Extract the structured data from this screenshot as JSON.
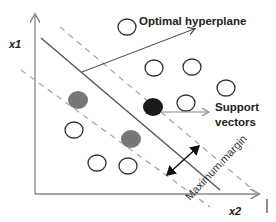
{
  "diagram": {
    "axes": {
      "y_label": "x1",
      "x_label": "x2"
    },
    "labels": {
      "hyperplane": "Optimal hyperplane",
      "support_line1": "Support",
      "support_line2": "vectors",
      "margin": "Maximum margin"
    },
    "colors": {
      "axis": "#888888",
      "hyperplane": "#555555",
      "margin_lines": "#aaaaaa",
      "open_circle_stroke": "#333333",
      "gray_point": "#777777",
      "black_point": "#1a1a1a",
      "arrow": "#333333"
    },
    "points": {
      "open": [
        {
          "x": 127,
          "y": 26
        },
        {
          "x": 154,
          "y": 68
        },
        {
          "x": 192,
          "y": 67
        },
        {
          "x": 226,
          "y": 88
        },
        {
          "x": 185,
          "y": 102
        },
        {
          "x": 74,
          "y": 130
        },
        {
          "x": 97,
          "y": 163
        },
        {
          "x": 128,
          "y": 165
        }
      ],
      "filled_gray": [
        {
          "x": 78,
          "y": 100
        },
        {
          "x": 131,
          "y": 138
        }
      ],
      "filled_black": [
        {
          "x": 153,
          "y": 107
        }
      ]
    }
  }
}
